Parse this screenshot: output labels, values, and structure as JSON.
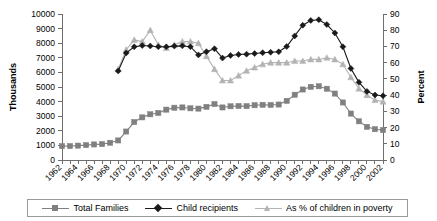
{
  "chart_data": {
    "type": "line",
    "title": "",
    "subtitle": "",
    "xlabel": "",
    "ylabel": "Thousands",
    "y2label": "Percent",
    "ylim": [
      0,
      10000
    ],
    "y2lim": [
      0,
      90
    ],
    "grid": false,
    "legend_position": "bottom",
    "x": [
      1962,
      1963,
      1964,
      1965,
      1966,
      1967,
      1968,
      1969,
      1970,
      1971,
      1972,
      1973,
      1974,
      1975,
      1976,
      1977,
      1978,
      1979,
      1980,
      1981,
      1982,
      1983,
      1984,
      1985,
      1986,
      1987,
      1988,
      1989,
      1990,
      1991,
      1992,
      1993,
      1994,
      1995,
      1996,
      1997,
      1998,
      1999,
      2000,
      2001,
      2002
    ],
    "x_tick_labels": [
      "1962",
      "1964",
      "1966",
      "1968",
      "1970",
      "1972",
      "1974",
      "1976",
      "1978",
      "1980",
      "1982",
      "1984",
      "1986",
      "1988",
      "1990",
      "1992",
      "1994",
      "1996",
      "1998",
      "2000",
      "2002"
    ],
    "y_tick_labels": [
      "0",
      "1000",
      "2000",
      "3000",
      "4000",
      "5000",
      "6000",
      "7000",
      "8000",
      "9000",
      "10000"
    ],
    "y2_tick_labels": [
      "0",
      "10",
      "20",
      "30",
      "40",
      "50",
      "60",
      "70",
      "80",
      "90"
    ],
    "series": [
      {
        "name": "Total Families",
        "axis": "left",
        "color": "#808080",
        "marker": "square",
        "values": [
          950,
          955,
          985,
          1020,
          1065,
          1090,
          1180,
          1340,
          1950,
          2600,
          2920,
          3130,
          3220,
          3450,
          3580,
          3600,
          3540,
          3520,
          3640,
          3830,
          3600,
          3680,
          3700,
          3690,
          3750,
          3780,
          3770,
          3800,
          4050,
          4470,
          4830,
          5010,
          5050,
          4880,
          4550,
          3940,
          3180,
          2650,
          2270,
          2110,
          2050
        ]
      },
      {
        "name": "Child recipients",
        "axis": "left",
        "color": "#1a1a1a",
        "marker": "diamond",
        "values": [
          null,
          null,
          null,
          null,
          null,
          null,
          null,
          6100,
          7330,
          7750,
          7840,
          7810,
          7760,
          7750,
          7800,
          7820,
          7760,
          7200,
          7420,
          7620,
          6980,
          7160,
          7230,
          7250,
          7290,
          7350,
          7380,
          7410,
          7770,
          8500,
          9230,
          9560,
          9610,
          9280,
          8700,
          7760,
          6270,
          5320,
          4700,
          4450,
          4400
        ]
      },
      {
        "name": "As % of children in poverty",
        "axis": "right",
        "color": "#b3b3b3",
        "marker": "triangle",
        "values": [
          null,
          null,
          null,
          null,
          null,
          null,
          null,
          56,
          68,
          74,
          73,
          80,
          71,
          69,
          71,
          73,
          73,
          72,
          64,
          56,
          49,
          49,
          52,
          55,
          57,
          59,
          60,
          60,
          60,
          61,
          61,
          62,
          62,
          63,
          62,
          59,
          51,
          44,
          40,
          37,
          36
        ]
      }
    ]
  },
  "legend": {
    "items": [
      {
        "label": "Total Families",
        "marker": "square",
        "color": "#808080"
      },
      {
        "label": "Child recipients",
        "marker": "diamond",
        "color": "#1a1a1a"
      },
      {
        "label": "As % of children in poverty",
        "marker": "triangle",
        "color": "#b3b3b3"
      }
    ]
  }
}
